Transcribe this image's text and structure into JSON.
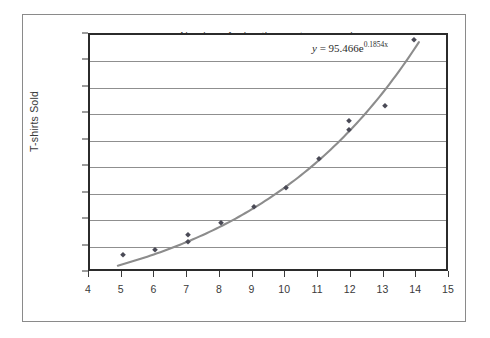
{
  "chart_data": {
    "type": "scatter",
    "title": "",
    "xlabel": "Number of advertisements per week",
    "ylabel": "T-shirts Sold",
    "xlim": [
      4,
      15
    ],
    "ylim": [
      200,
      1325
    ],
    "xticks": [
      "4",
      "5",
      "6",
      "7",
      "8",
      "9",
      "10",
      "11",
      "12",
      "13",
      "14",
      "15"
    ],
    "yticks": [
      "200",
      "325",
      "450",
      "575",
      "700",
      "825",
      "950",
      "1075",
      "1200",
      "1325"
    ],
    "grid": "horizontal",
    "legend": "none",
    "marker_color": "#4a4a56",
    "trendline_color": "#8c8c8c",
    "points": [
      {
        "x": 5,
        "y": 285
      },
      {
        "x": 6,
        "y": 310
      },
      {
        "x": 7,
        "y": 345
      },
      {
        "x": 7,
        "y": 380
      },
      {
        "x": 8,
        "y": 435
      },
      {
        "x": 9,
        "y": 510
      },
      {
        "x": 10,
        "y": 600
      },
      {
        "x": 11,
        "y": 740
      },
      {
        "x": 11.9,
        "y": 875
      },
      {
        "x": 11.9,
        "y": 920
      },
      {
        "x": 13,
        "y": 990
      },
      {
        "x": 13.9,
        "y": 1300
      }
    ],
    "trendline": {
      "type": "exponential",
      "a": 95.466,
      "b": 0.1854,
      "equation_prefix": "y",
      "equation_eq": " = 95.466e",
      "equation_exponent": "0.1854x",
      "equation_full": "y = 95.466e^0.1854x"
    },
    "annotations": [
      {
        "name": "trendline-equation",
        "text": "y = 95.466e0.1854x"
      }
    ]
  },
  "axes": {
    "y_title": "T-shirts Sold",
    "x_title": "Number of advertisements per week"
  }
}
